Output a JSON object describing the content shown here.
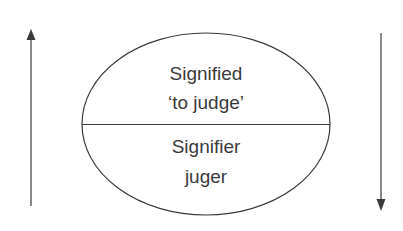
{
  "diagram": {
    "type": "saussurean-sign",
    "top_half": {
      "title": "Signified",
      "subtitle": "‘to judge’"
    },
    "bottom_half": {
      "title": "Signifier",
      "subtitle": "juger"
    },
    "left_arrow": {
      "direction": "up"
    },
    "right_arrow": {
      "direction": "down"
    },
    "colors": {
      "stroke": "#3a3a3a",
      "text": "#3a3a3a",
      "background": "#ffffff"
    }
  }
}
